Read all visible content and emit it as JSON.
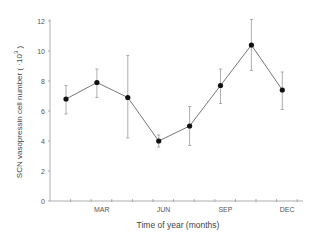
{
  "chart_data": {
    "type": "line",
    "title": "",
    "xlabel": "Time of year  (months)",
    "ylabel": "SCN vasopressin cell number (×10³)",
    "ylabel_main": "SCN vasopressin cell number ( ·10",
    "ylabel_exp": "3",
    "ylabel_close": " )",
    "ylim": [
      0,
      12
    ],
    "yticks": [
      0,
      2,
      4,
      6,
      8,
      10,
      12
    ],
    "ytick_labels": [
      "0",
      "2",
      "4",
      "6",
      "8",
      "10",
      "12"
    ],
    "xtick_labels": [
      "MAR",
      "JUN",
      "SEP",
      "DEC"
    ],
    "xtick_months": [
      3,
      6,
      9,
      12
    ],
    "minor_ticks_months": [
      1,
      2,
      3,
      4,
      5,
      6,
      7,
      8,
      9,
      10,
      11,
      12
    ],
    "grid": false,
    "legend": null,
    "series": [
      {
        "name": "SCN vasopressin cell number",
        "x_months": [
          1.5,
          3,
          4.5,
          6,
          7.5,
          9,
          10.5,
          12
        ],
        "values": [
          6.8,
          7.9,
          6.9,
          4.0,
          5.0,
          7.7,
          10.4,
          7.4
        ],
        "err_high": [
          7.7,
          8.8,
          9.7,
          4.4,
          6.3,
          8.8,
          12.1,
          8.6
        ],
        "err_low": [
          5.8,
          6.9,
          4.2,
          3.6,
          3.7,
          6.5,
          8.7,
          6.1
        ]
      }
    ]
  },
  "colors": {
    "line": "#777777",
    "marker": "#111111",
    "axis": "#999999",
    "text": "#444444"
  }
}
